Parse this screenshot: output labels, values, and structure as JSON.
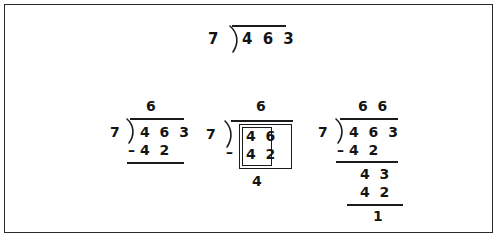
{
  "figure": {
    "type": "long-division-worked-example",
    "operation": "463 / 7",
    "divisor": "7",
    "dividend": "463",
    "quotient": "66",
    "remainder": "1"
  },
  "top_problem": {
    "divisor": "7",
    "dividend": "4 6 3"
  },
  "steps": [
    {
      "id": "step-1",
      "divisor": "7",
      "dividend": "4 6 3",
      "quotient": "6",
      "minus_sign": "–",
      "subtrahend": "4 2"
    },
    {
      "id": "step-2",
      "divisor": "7",
      "quotient": "6",
      "minus_sign": "–",
      "boxed_top": "4 6",
      "boxed_bottom": "4 2",
      "difference": "4"
    },
    {
      "id": "step-3",
      "divisor": "7",
      "dividend": "4 6 3",
      "quotient": "6 6",
      "minus_sign": "–",
      "subtrahend_1": "4 2",
      "bring_down": "4 3",
      "subtrahend_2": "4 2",
      "remainder": "1"
    }
  ],
  "colors": {
    "ink": "#141414",
    "rule": "#1b1b1b",
    "frame": "#2b2b2b",
    "background": "#ffffff"
  }
}
